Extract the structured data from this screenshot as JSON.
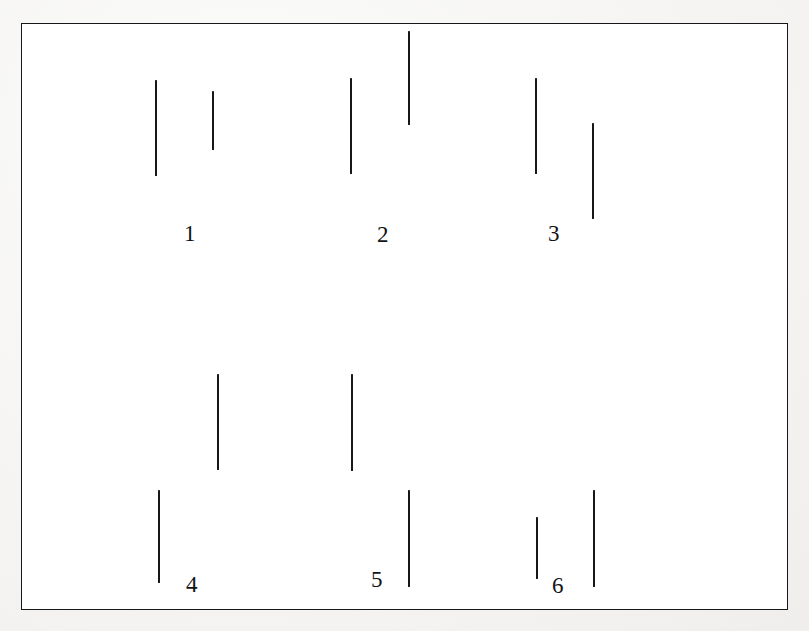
{
  "figure": {
    "background_color": "#f6f5f3",
    "panel_color": "#ffffff",
    "ink_color": "#16171a",
    "canvas": {
      "width": 809,
      "height": 631
    }
  },
  "frame": {
    "name": "panel-border",
    "x": 21,
    "y": 23,
    "width": 767,
    "height": 587,
    "border_width": 1.6,
    "border_color": "#16171a"
  },
  "label_style": {
    "font_size": 23,
    "color": "#111315"
  },
  "groups": [
    {
      "id": "group-1",
      "label": "1",
      "label_x": 184,
      "label_y": 222,
      "lines": [
        {
          "name": "line-1a",
          "x": 155,
          "y_top": 80,
          "y_bottom": 176,
          "thickness": 1.7
        },
        {
          "name": "line-1b",
          "x": 212,
          "y_top": 91,
          "y_bottom": 150,
          "thickness": 1.5
        }
      ]
    },
    {
      "id": "group-2",
      "label": "2",
      "label_x": 377,
      "label_y": 223,
      "lines": [
        {
          "name": "line-2a",
          "x": 350,
          "y_top": 78,
          "y_bottom": 174,
          "thickness": 1.7
        },
        {
          "name": "line-2b",
          "x": 408,
          "y_top": 31,
          "y_bottom": 125,
          "thickness": 1.7
        }
      ]
    },
    {
      "id": "group-3",
      "label": "3",
      "label_x": 548,
      "label_y": 222,
      "lines": [
        {
          "name": "line-3a",
          "x": 535,
          "y_top": 78,
          "y_bottom": 174,
          "thickness": 1.7
        },
        {
          "name": "line-3b",
          "x": 592,
          "y_top": 123,
          "y_bottom": 219,
          "thickness": 1.7
        }
      ]
    },
    {
      "id": "group-4",
      "label": "4",
      "label_x": 186,
      "label_y": 573,
      "lines": [
        {
          "name": "line-4a",
          "x": 158,
          "y_top": 490,
          "y_bottom": 583,
          "thickness": 1.7
        },
        {
          "name": "line-4b",
          "x": 217,
          "y_top": 374,
          "y_bottom": 470,
          "thickness": 1.7
        }
      ]
    },
    {
      "id": "group-5",
      "label": "5",
      "label_x": 371,
      "label_y": 568,
      "lines": [
        {
          "name": "line-5a",
          "x": 351,
          "y_top": 374,
          "y_bottom": 471,
          "thickness": 1.7
        },
        {
          "name": "line-5b",
          "x": 408,
          "y_top": 490,
          "y_bottom": 587,
          "thickness": 1.7
        }
      ]
    },
    {
      "id": "group-6",
      "label": "6",
      "label_x": 552,
      "label_y": 574,
      "lines": [
        {
          "name": "line-6a",
          "x": 536,
          "y_top": 517,
          "y_bottom": 579,
          "thickness": 1.6
        },
        {
          "name": "line-6b",
          "x": 593,
          "y_top": 490,
          "y_bottom": 587,
          "thickness": 1.7
        }
      ]
    }
  ]
}
